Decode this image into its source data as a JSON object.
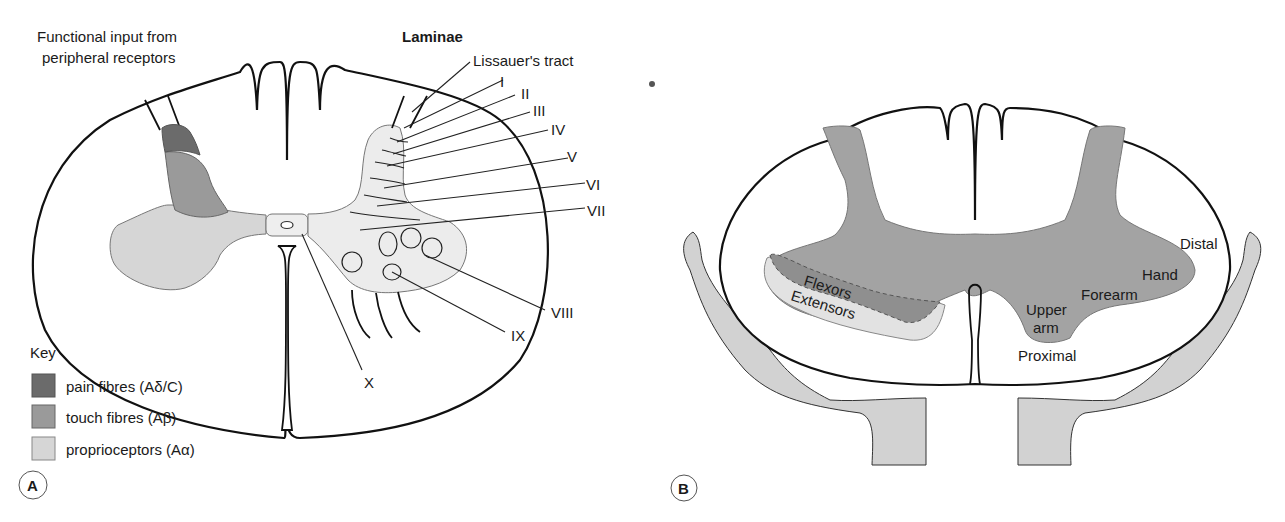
{
  "panel_a": {
    "badge": "A",
    "input_label_line1": "Functional input from",
    "input_label_line2": "peripheral receptors",
    "laminae_heading": "Laminae",
    "lissauer_label": "Lissauer's tract",
    "laminae": [
      "I",
      "II",
      "III",
      "IV",
      "V",
      "VI",
      "VII",
      "VIII",
      "IX",
      "X"
    ],
    "key": {
      "title": "Key",
      "items": [
        {
          "label": "pain fibres (Aδ/C)",
          "color": "#6b6b6b"
        },
        {
          "label": "touch fibres (Aβ)",
          "color": "#9a9a9a"
        },
        {
          "label": "proprioceptors (Aα)",
          "color": "#d6d6d6"
        }
      ]
    }
  },
  "panel_b": {
    "badge": "B",
    "labels": {
      "flexors": "Flexors",
      "extensors": "Extensors",
      "distal": "Distal",
      "hand": "Hand",
      "forearm": "Forearm",
      "upper": "Upper",
      "arm": "arm",
      "proximal": "Proximal"
    }
  },
  "colors": {
    "grey_matter_b": "#a3a3a3",
    "limb": "#d2d2d2",
    "light_fill": "#e8e8e8"
  }
}
